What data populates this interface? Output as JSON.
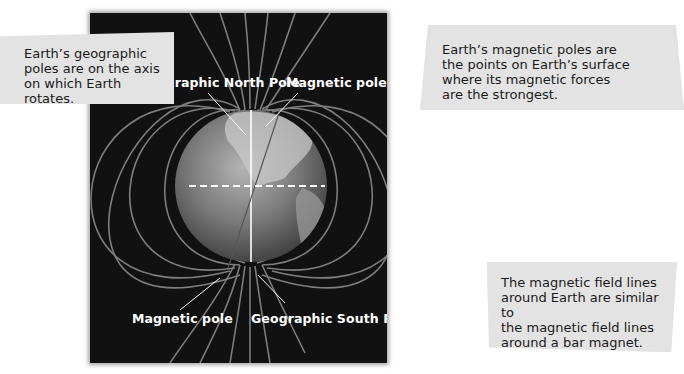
{
  "diagram": {
    "labels": {
      "geographic_north": "Geographic North Pole",
      "magnetic_pole_top": "Magnetic pole",
      "magnetic_pole_bottom": "Magnetic pole",
      "geographic_south": "Geographic South Pole"
    },
    "callouts": {
      "geographic_poles": "Earth’s geographic\npoles are on the axis\non which Earth rotates.",
      "magnetic_poles": "Earth’s magnetic poles are\nthe points on Earth’s surface\nwhere its magnetic forces\nare the strongest.",
      "field_lines": "The magnetic field lines\naround Earth are similar to\nthe magnetic field lines\naround a bar magnet."
    },
    "colors": {
      "panel_background": "#111111",
      "field_line": "#8a8a8a",
      "callout_background": "#e3e3e3",
      "label_text": "#ffffff"
    }
  }
}
